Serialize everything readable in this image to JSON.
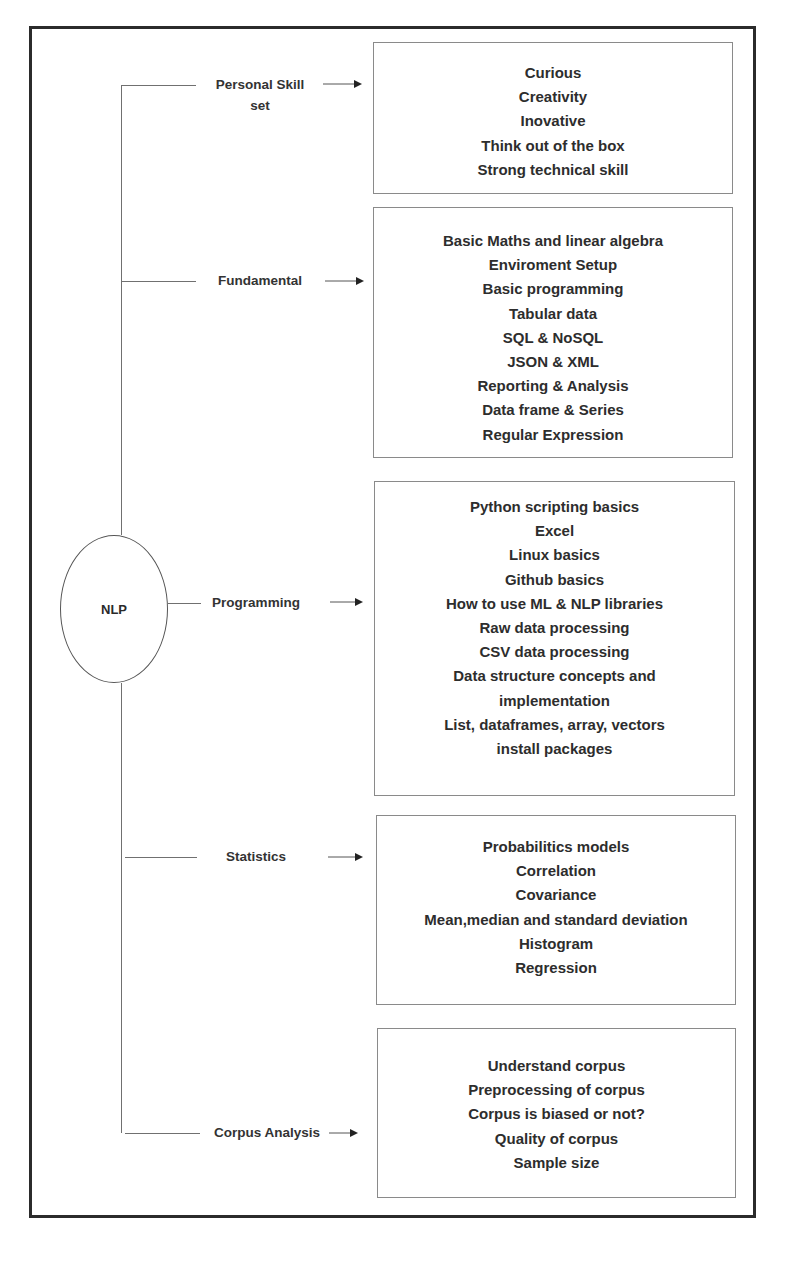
{
  "diagram": {
    "root": {
      "label": "NLP"
    },
    "branches": [
      {
        "label": "Personal Skill\nset",
        "items": [
          "Curious",
          "Creativity",
          "Inovative",
          "Think out of the box",
          "Strong technical skill"
        ]
      },
      {
        "label": "Fundamental",
        "items": [
          "Basic Maths and linear algebra",
          "Enviroment Setup",
          "Basic programming",
          "Tabular data",
          "SQL & NoSQL",
          "JSON & XML",
          "Reporting & Analysis",
          "Data frame & Series",
          "Regular Expression"
        ]
      },
      {
        "label": "Programming",
        "items": [
          "Python scripting basics",
          "Excel",
          "Linux basics",
          "Github basics",
          "How to use ML & NLP libraries",
          "Raw data processing",
          "CSV data processing",
          "Data structure concepts and",
          "implementation",
          "List, dataframes, array, vectors",
          "install packages"
        ]
      },
      {
        "label": "Statistics",
        "items": [
          "Probabilitics models",
          "Correlation",
          "Covariance",
          "Mean,median and standard deviation",
          "Histogram",
          "Regression"
        ]
      },
      {
        "label": "Corpus Analysis",
        "items": [
          "Understand corpus",
          "Preprocessing of corpus",
          "Corpus is biased or not?",
          "Quality of corpus",
          "Sample size"
        ]
      }
    ]
  }
}
